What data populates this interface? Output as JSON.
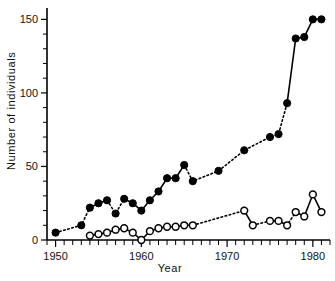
{
  "chart_data": {
    "type": "line",
    "title": "",
    "xlabel": "Year",
    "ylabel": "Number of individuals",
    "xlim": [
      1949,
      1982
    ],
    "ylim": [
      0,
      155
    ],
    "grid": false,
    "legend": "none",
    "x_ticks_major": [
      1950,
      1960,
      1970,
      1980
    ],
    "x_tick_labels": [
      "1950",
      "1960",
      "1970",
      "1980"
    ],
    "x_tick_minor_step": 1,
    "y_ticks_major": [
      0,
      50,
      100,
      150
    ],
    "y_tick_labels": [
      "0",
      "50",
      "100",
      "150"
    ],
    "y_tick_minor_step": 10,
    "series": [
      {
        "name": "filled-circles",
        "marker": "filled-circle",
        "color": "#000000",
        "x": [
          1950,
          1953,
          1954,
          1955,
          1956,
          1957,
          1958,
          1959,
          1960,
          1961,
          1962,
          1963,
          1964,
          1965,
          1966,
          1969,
          1972,
          1975,
          1976,
          1977,
          1978,
          1979,
          1980,
          1981
        ],
        "values": [
          5,
          10,
          22,
          25,
          27,
          18,
          28,
          25,
          20,
          27,
          33,
          42,
          42,
          51,
          40,
          47,
          61,
          70,
          72,
          93,
          137,
          138,
          150,
          150
        ],
        "segments": [
          {
            "style": "dotted",
            "from": 1950,
            "to": 1954
          },
          {
            "style": "solid",
            "from": 1954,
            "to": 1956
          },
          {
            "style": "dotted",
            "from": 1956,
            "to": 1958
          },
          {
            "style": "solid",
            "from": 1958,
            "to": 1965
          },
          {
            "style": "dotted",
            "from": 1965,
            "to": 1977
          },
          {
            "style": "solid",
            "from": 1977,
            "to": 1981
          }
        ]
      },
      {
        "name": "open-circles",
        "marker": "open-circle",
        "color": "#000000",
        "x": [
          1954,
          1955,
          1956,
          1957,
          1958,
          1959,
          1960,
          1961,
          1962,
          1963,
          1964,
          1965,
          1966,
          1972,
          1973,
          1975,
          1976,
          1977,
          1978,
          1979,
          1980,
          1981
        ],
        "values": [
          3,
          4,
          5,
          7,
          8,
          5,
          0,
          6,
          8,
          9,
          9,
          10,
          10,
          20,
          10,
          13,
          13,
          10,
          19,
          16,
          31,
          19
        ],
        "segments": [
          {
            "style": "solid",
            "from": 1954,
            "to": 1966
          },
          {
            "style": "dotted",
            "from": 1966,
            "to": 1972
          },
          {
            "style": "solid",
            "from": 1972,
            "to": 1973
          },
          {
            "style": "dotted",
            "from": 1973,
            "to": 1975
          },
          {
            "style": "solid",
            "from": 1975,
            "to": 1976
          },
          {
            "style": "dotted",
            "from": 1976,
            "to": 1978
          },
          {
            "style": "solid",
            "from": 1978,
            "to": 1981
          }
        ]
      }
    ]
  }
}
